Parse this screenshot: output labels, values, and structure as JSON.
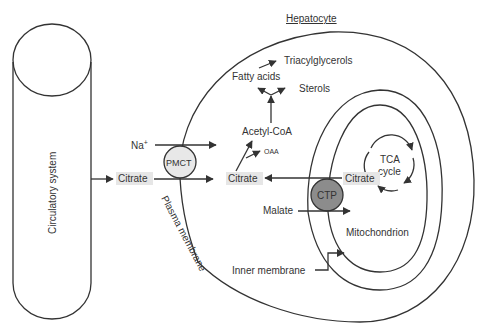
{
  "diagram": {
    "title": "Hepatocyte",
    "vessel": {
      "label": "Circulatory system"
    },
    "membranes": {
      "plasma": "Plasma membrane",
      "inner": "Inner membrane",
      "organelle": "Mitochondrion"
    },
    "transporters": {
      "plasma": "PMCT",
      "mito": "CTP"
    },
    "molecules": {
      "na": "Na",
      "na_sup": "+",
      "citrate_blood": "Citrate",
      "citrate_cyto": "Citrate",
      "citrate_mito": "Citrate",
      "acetyl_coa": "Acetyl-CoA",
      "oaa": "OAA",
      "fatty_acids": "Fatty acids",
      "triacylglycerols": "Triacylglycerols",
      "sterols": "Sterols",
      "malate": "Malate"
    },
    "cycle": {
      "line1": "TCA",
      "line2": "cycle"
    },
    "colors": {
      "line": "#333333",
      "highlight_box": "#e6e6e6",
      "pmct_fill": "#e8e8e8",
      "ctp_fill": "#8c8c8c"
    }
  }
}
